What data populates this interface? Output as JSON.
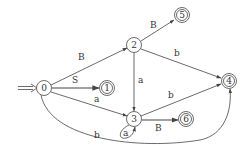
{
  "diagram": {
    "type": "finite-automaton",
    "start_state": "0",
    "states": [
      {
        "id": "0",
        "label": "0",
        "accepting": false,
        "x": 44,
        "y": 88
      },
      {
        "id": "1",
        "label": "1",
        "accepting": true,
        "x": 107,
        "y": 88
      },
      {
        "id": "2",
        "label": "2",
        "accepting": false,
        "x": 134,
        "y": 45
      },
      {
        "id": "3",
        "label": "3",
        "accepting": false,
        "x": 134,
        "y": 119
      },
      {
        "id": "4",
        "label": "4",
        "accepting": true,
        "x": 229,
        "y": 81
      },
      {
        "id": "5",
        "label": "5",
        "accepting": true,
        "x": 182,
        "y": 15
      },
      {
        "id": "6",
        "label": "6",
        "accepting": true,
        "x": 186,
        "y": 119
      }
    ],
    "transitions": [
      {
        "from": "0",
        "to": "2",
        "label": "B"
      },
      {
        "from": "0",
        "to": "1",
        "label": "S"
      },
      {
        "from": "0",
        "to": "3",
        "label": "a"
      },
      {
        "from": "0",
        "to": "4",
        "label": "b"
      },
      {
        "from": "2",
        "to": "5",
        "label": "B"
      },
      {
        "from": "2",
        "to": "4",
        "label": "b"
      },
      {
        "from": "2",
        "to": "3",
        "label": "a"
      },
      {
        "from": "3",
        "to": "3",
        "label": "a"
      },
      {
        "from": "3",
        "to": "4",
        "label": "b"
      },
      {
        "from": "3",
        "to": "6",
        "label": "B"
      }
    ]
  }
}
